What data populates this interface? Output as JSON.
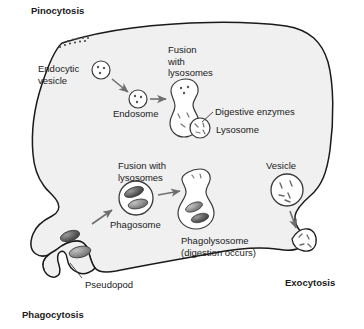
{
  "figure": {
    "title_visible": false,
    "type": "cell-biology-diagram"
  },
  "colors": {
    "background": "#ffffff",
    "cytoplasm": "#f0f0f0",
    "membrane_stroke": "#1a1a1a",
    "organelle_fill": "#ffffff",
    "organelle_stroke": "#3a3a3a",
    "bacteria_dark": "#4a4a4a",
    "bacteria_light": "#8c8c8c",
    "arrow": "#6e6e6e",
    "leader_line": "#3a3a3a",
    "text": "#1a1a1a"
  },
  "labels": {
    "pinocytosis": "Pinocytosis",
    "phagocytosis": "Phagocytosis",
    "exocytosis": "Exocytosis",
    "endocytic_vesicle": "Endocytic\nvesicle",
    "endosome": "Endosome",
    "fusion_with_lysosomes_top": "Fusion\nwith\nlysosomes",
    "digestive_enzymes": "Digestive enzymes",
    "lysosome": "Lysosome",
    "fusion_with_lysosomes_mid": "Fusion with\nlysosomes",
    "phagosome": "Phagosome",
    "phagolysosome": "Phagolysosome\n(digestion occurs)",
    "vesicle": "Vesicle",
    "pseudopod": "Pseudopod"
  },
  "icons": {
    "cell": "cell-membrane-shape",
    "endocytic_vesicle": "small-vesicle-icon",
    "endosome": "endosome-icon",
    "fused_endosome": "fused-endosome-peanut-icon",
    "lysosome": "lysosome-icon",
    "phagosome": "phagosome-icon",
    "phagolysosome": "phagolysosome-icon",
    "secretory_vesicle": "secretory-vesicle-icon",
    "pseudopod": "pseudopod-icon",
    "bacteria": "bacterium-icon",
    "arrow": "arrow-icon",
    "dots": "pinocytosis-dots-icon"
  }
}
